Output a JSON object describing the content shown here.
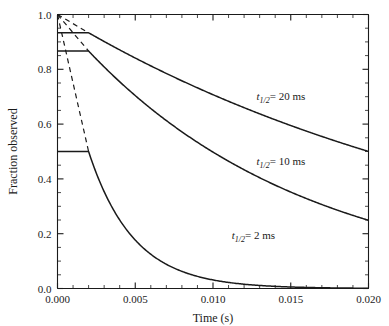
{
  "chart_data": {
    "type": "line",
    "title": "",
    "xlabel": "Time (s)",
    "ylabel": "Fraction observed",
    "xlim": [
      0.0,
      0.02
    ],
    "ylim": [
      0.0,
      1.0
    ],
    "xticks": [
      0.0,
      0.005,
      0.01,
      0.015,
      0.02
    ],
    "xtick_labels": [
      "0.000",
      "0.005",
      "0.010",
      "0.015",
      "0.020"
    ],
    "yticks": [
      0.0,
      0.2,
      0.4,
      0.6,
      0.8,
      1.0
    ],
    "ytick_labels": [
      "0.0",
      "0.2",
      "0.4",
      "0.6",
      "0.8",
      "1.0"
    ],
    "x_minor_step": 0.001,
    "y_minor_step": 0.05,
    "grid": false,
    "legend": "inline-annotations",
    "break_time": 0.002,
    "series": [
      {
        "name": "t_half_20ms",
        "half_life_ms": 20,
        "plateau_value": 0.9333,
        "x": [
          0.0,
          0.002,
          0.003,
          0.004,
          0.005,
          0.006,
          0.007,
          0.008,
          0.009,
          0.01,
          0.011,
          0.012,
          0.013,
          0.014,
          0.015,
          0.016,
          0.017,
          0.018,
          0.019,
          0.02
        ],
        "y": [
          0.9333,
          0.9333,
          0.9015,
          0.8707,
          0.841,
          0.8123,
          0.7846,
          0.7578,
          0.732,
          0.707,
          0.6829,
          0.6596,
          0.6371,
          0.6154,
          0.5944,
          0.5741,
          0.5545,
          0.5356,
          0.5173,
          0.4997
        ]
      },
      {
        "name": "t_half_10ms",
        "half_life_ms": 10,
        "plateau_value": 0.8667,
        "x": [
          0.0,
          0.002,
          0.003,
          0.004,
          0.005,
          0.006,
          0.007,
          0.008,
          0.009,
          0.01,
          0.011,
          0.012,
          0.013,
          0.014,
          0.015,
          0.016,
          0.017,
          0.018,
          0.019,
          0.02
        ],
        "y": [
          0.8667,
          0.8667,
          0.8083,
          0.7539,
          0.7031,
          0.6558,
          0.6116,
          0.5705,
          0.532,
          0.4962,
          0.4628,
          0.4316,
          0.4026,
          0.3755,
          0.3502,
          0.3266,
          0.3046,
          0.2841,
          0.265,
          0.2472
        ]
      },
      {
        "name": "t_half_2ms",
        "half_life_ms": 2,
        "plateau_value": 0.5,
        "x": [
          0.0,
          0.002,
          0.003,
          0.004,
          0.005,
          0.006,
          0.007,
          0.008,
          0.009,
          0.01,
          0.011,
          0.012,
          0.013,
          0.014,
          0.015,
          0.016,
          0.017,
          0.018,
          0.019,
          0.02
        ],
        "y": [
          0.5,
          0.5,
          0.3536,
          0.25,
          0.1768,
          0.125,
          0.0884,
          0.0625,
          0.0442,
          0.03125,
          0.0221,
          0.0156,
          0.011,
          0.0078,
          0.0055,
          0.0039,
          0.0028,
          0.002,
          0.0014,
          0.001
        ]
      }
    ],
    "extrapolations": [
      {
        "name": "extrap-20ms",
        "style": "dashed",
        "x": [
          0.0,
          0.002
        ],
        "y": [
          1.0,
          0.9333
        ]
      },
      {
        "name": "extrap-10ms",
        "style": "dashed",
        "x": [
          0.0,
          0.002
        ],
        "y": [
          1.0,
          0.8667
        ]
      },
      {
        "name": "extrap-2ms",
        "style": "dashed",
        "x": [
          0.0,
          0.002
        ],
        "y": [
          1.0,
          0.5
        ]
      }
    ],
    "annotations": [
      {
        "name": "label-20ms",
        "symbol": "t",
        "subscript": "1/2",
        "text": "= 20 ms",
        "full_text": "t1/2 = 20 ms",
        "x": 0.0128,
        "y": 0.688
      },
      {
        "name": "label-10ms",
        "symbol": "t",
        "subscript": "1/2",
        "text": "= 10 ms",
        "full_text": "t1/2 = 10 ms",
        "x": 0.0128,
        "y": 0.452
      },
      {
        "name": "label-2ms",
        "symbol": "t",
        "subscript": "1/2",
        "text": "= 2 ms",
        "full_text": "t1/2 = 2 ms",
        "x": 0.0112,
        "y": 0.182
      }
    ],
    "colors": {
      "curve": "#1a1a1a",
      "axis": "#1a1a1a",
      "background": "#ffffff"
    }
  }
}
